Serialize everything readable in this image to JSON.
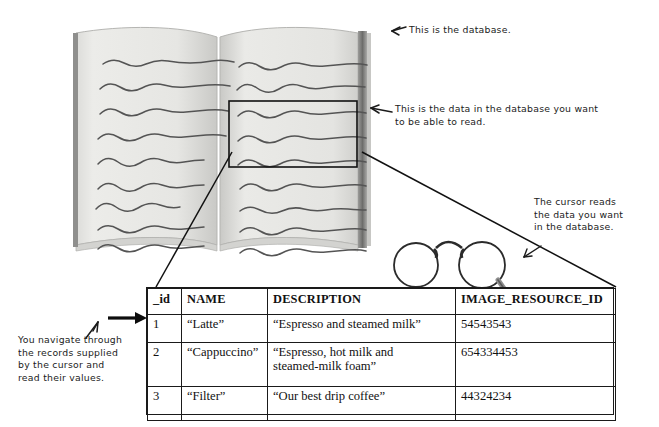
{
  "figure": {
    "annotations": {
      "database": "This is the database.",
      "data_in_database": "This is the data in the database you want\nto be able to read.",
      "cursor": "The cursor reads\nthe data you want\nin the database.",
      "navigate": "You navigate through\nthe records supplied\nby the cursor and\nread their values."
    },
    "icons": {
      "arrow_database": "arrow-left-icon",
      "arrow_data": "arrow-left-icon",
      "arrow_cursor": "arrow-left-icon",
      "arrow_records": "arrow-up-icon",
      "arrow_row_pointer": "arrow-right-icon",
      "glasses": "spectacles-cursor-icon",
      "book": "open-book-icon"
    },
    "colors": {
      "ink": "#1a1a1a",
      "page": "#e9e9e7",
      "page_shadow": "#b9b9b7",
      "spine": "#6f6f6f",
      "squiggle": "#4a4a4a"
    }
  },
  "db_table": {
    "columns": [
      "_id",
      "NAME",
      "DESCRIPTION",
      "IMAGE_RESOURCE_ID"
    ],
    "rows": [
      {
        "id": "1",
        "name": "“Latte”",
        "description": "“Espresso and steamed milk”",
        "image_resource_id": "54543543"
      },
      {
        "id": "2",
        "name": "“Cappuccino”",
        "description": "“Espresso, hot milk and\n steamed-milk foam”",
        "image_resource_id": "654334453"
      },
      {
        "id": "3",
        "name": "“Filter”",
        "description": "“Our best drip coffee”",
        "image_resource_id": "44324234"
      }
    ]
  }
}
